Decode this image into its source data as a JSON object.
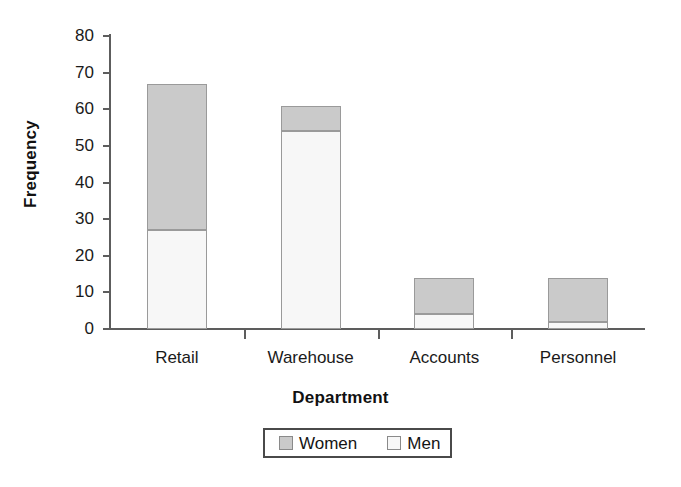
{
  "chart_data": {
    "type": "bar",
    "variant": "stacked-vertical",
    "title": "",
    "xlabel": "Department",
    "ylabel": "Frequency",
    "categories": [
      "Retail",
      "Warehouse",
      "Accounts",
      "Personnel"
    ],
    "series": [
      {
        "name": "Men",
        "values": [
          27,
          54,
          4,
          2
        ],
        "color": "#f7f7f7"
      },
      {
        "name": "Women",
        "values": [
          40,
          7,
          10,
          12
        ],
        "color": "#cacaca"
      }
    ],
    "totals": [
      67,
      61,
      14,
      14
    ],
    "ylim": [
      0,
      80
    ],
    "ytick_values": [
      0,
      10,
      20,
      30,
      40,
      50,
      60,
      70,
      80
    ],
    "ytick_labels": [
      "0",
      "10",
      "20",
      "30",
      "40",
      "50",
      "60",
      "70",
      "80"
    ],
    "grid": false,
    "legend_position": "bottom",
    "legend_entries": [
      "Women",
      "Men"
    ],
    "axis_color": "#5d5d5d",
    "bar_border_color": "#9a9a9a"
  }
}
